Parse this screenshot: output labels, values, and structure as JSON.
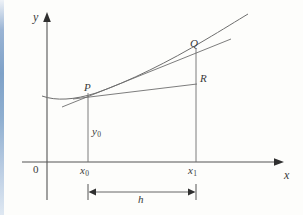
{
  "figure": {
    "type": "math-diagram",
    "background_color": "#fdfdfb",
    "stroke_color": "#4a4a4a",
    "left_strip_color": "#8fafd0"
  },
  "axes": {
    "y_label": "y",
    "x_label": "x",
    "origin_label": "0",
    "y_axis": {
      "x": 47,
      "top": 13,
      "bottom": 200,
      "arrow": "up"
    },
    "x_axis": {
      "y": 162,
      "left": 22,
      "right": 283,
      "arrow": "right"
    }
  },
  "points": [
    {
      "name": "P",
      "label": "P",
      "x": 88,
      "y": 97
    },
    {
      "name": "Q",
      "label": "Q",
      "x": 196,
      "y": 53
    },
    {
      "name": "R",
      "label": "R",
      "x": 196,
      "y": 84
    }
  ],
  "ordinates": [
    {
      "name": "x0",
      "label": "x",
      "sub": "0",
      "x": 88
    },
    {
      "name": "x1",
      "label": "x",
      "sub": "1",
      "x": 196
    }
  ],
  "segments": {
    "y0_label": "y",
    "y0_sub": "0",
    "h_label": "h"
  },
  "curve": {
    "path": "M 42 96 C 56 101 74 100 96 93 C 128 82 170 61 205 40 C 222 30 238 20 248 14"
  },
  "chord_PQ": {
    "x1": 68,
    "y1": 105,
    "x2": 228,
    "y2": 40
  },
  "segment_PR": {
    "x1": 88,
    "y1": 97,
    "x2": 196,
    "y2": 84
  },
  "dimension_h": {
    "y": 192,
    "x_from": 88,
    "x_to": 196
  }
}
